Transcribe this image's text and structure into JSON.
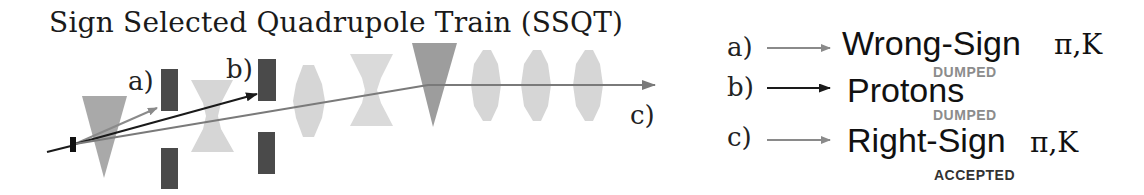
{
  "title": "Sign Selected Quadrupole Train (SSQT)",
  "beam_labels": {
    "a": "a)",
    "b": "b)",
    "c": "c)"
  },
  "legend": [
    {
      "key": "a)",
      "arrow_color": "#8a8a8a",
      "label": "Wrong-Sign",
      "particles": "π,K",
      "status": "DUMPED",
      "status_color": "#8c8c8c"
    },
    {
      "key": "b)",
      "arrow_color": "#1a1a1a",
      "label": "Protons",
      "particles": "",
      "status": "DUMPED",
      "status_color": "#8c8c8c"
    },
    {
      "key": "c)",
      "arrow_color": "#8a8a8a",
      "label": "Right-Sign",
      "particles": "π,K",
      "status": "ACCEPTED",
      "status_color": "#333333"
    }
  ],
  "colors": {
    "target": "#111111",
    "dipole_triangle_1": "#a9a9a9",
    "dipole_triangle_2": "#999999",
    "collimator": "#4a4a4a",
    "quadrupole": "#d6d6d6",
    "beam_wrong_sign": "#8a8a8a",
    "beam_proton": "#1a1a1a",
    "beam_right_sign": "#7a7a7a"
  }
}
